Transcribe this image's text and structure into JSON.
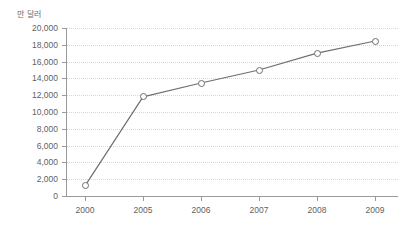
{
  "chart_data": {
    "type": "line",
    "title": "",
    "subtitle": "",
    "unit_label": "만 달러",
    "xlabel": "",
    "ylabel": "",
    "categories": [
      "2000",
      "2005",
      "2006",
      "2007",
      "2008",
      "2009"
    ],
    "series": [
      {
        "name": "",
        "values": [
          1200,
          11800,
          13450,
          15000,
          17000,
          18450
        ]
      }
    ],
    "ylim": [
      0,
      20000
    ],
    "ytick_labels": [
      "0",
      "2,000",
      "4,000",
      "6,000",
      "8,000",
      "10,000",
      "12,000",
      "14,000",
      "16,000",
      "18,000",
      "20,000"
    ],
    "ytick_values": [
      0,
      2000,
      4000,
      6000,
      8000,
      10000,
      12000,
      14000,
      16000,
      18000,
      20000
    ],
    "xtick_labels": [
      "2000",
      "2005",
      "2006",
      "2007",
      "2008",
      "2009"
    ],
    "grid": true,
    "grid_style": "dotted-horizontal",
    "legend": "none",
    "marker": "open-circle",
    "line_color": "#6e6e6e",
    "marker_fill": "#ffffff",
    "axis_color": "#9a9a9a",
    "grid_color": "#d8d8d8",
    "text_color": "#5f5f5f",
    "background": "#ffffff"
  }
}
